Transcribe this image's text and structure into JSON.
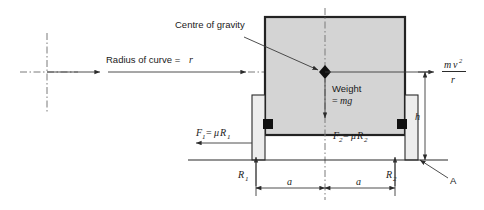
{
  "figure": {
    "title_visible": false,
    "background_color": "#ffffff",
    "body_fill": "#d4d4d4",
    "wheel_fill": "#ededed",
    "line_color": "#2b2b2b",
    "centerline_color": "#7a7a7a"
  },
  "labels": {
    "centre_of_gravity": "Centre of gravity",
    "radius_of_curve": "Radius of curve =",
    "radius_symbol": "r",
    "weight_line1": "Weight",
    "weight_line2": "=",
    "weight_symbol": "mg",
    "centrifugal_numerator_m": "m",
    "centrifugal_numerator_v": "v",
    "centrifugal_exponent": "2",
    "centrifugal_denominator": "r",
    "friction_left_f": "F",
    "friction_left_f_sub": "1",
    "friction_left_eq": "=",
    "friction_left_mu": "μ",
    "friction_left_r": "R",
    "friction_left_r_sub": "1",
    "friction_right_f": "F",
    "friction_right_f_sub": "2",
    "friction_right_eq": "=",
    "friction_right_mu": "μ",
    "friction_right_r": "R",
    "friction_right_r_sub": "2",
    "reaction_left": "R",
    "reaction_left_sub": "1",
    "reaction_right": "R",
    "reaction_right_sub": "2",
    "height_symbol": "h",
    "dimension_left": "a",
    "dimension_right": "a",
    "point_label": "A"
  },
  "geometry": {
    "body": {
      "x": 265,
      "y": 17,
      "width": 140,
      "height": 118
    },
    "wheel_left": {
      "x": 252,
      "y": 95,
      "width": 13,
      "height": 65
    },
    "wheel_right": {
      "x": 405,
      "y": 95,
      "width": 13,
      "height": 65
    },
    "cg_point": {
      "x": 325,
      "y": 72
    },
    "curve_centre": {
      "x": 47,
      "y": 72
    },
    "ground_y": 160,
    "dimension_y": 188,
    "half_track_label": "a"
  }
}
